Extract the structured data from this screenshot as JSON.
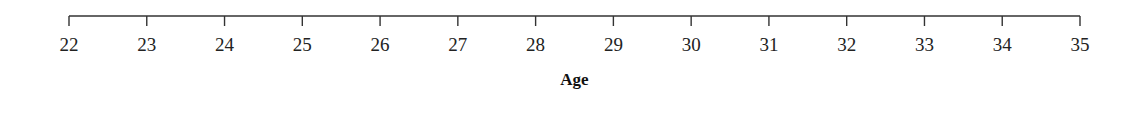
{
  "chart_data": {
    "type": "axis",
    "orientation": "horizontal",
    "xlabel": "Age",
    "ticks": [
      22,
      23,
      24,
      25,
      26,
      27,
      28,
      29,
      30,
      31,
      32,
      33,
      34,
      35
    ],
    "xlim": [
      22,
      35
    ],
    "grid": false,
    "series": []
  },
  "layout": {
    "x_start_px": 69,
    "x_end_px": 1080,
    "axis_y_px": 16,
    "tick_len_px": 10,
    "label_y_px": 51,
    "title_y_px": 85,
    "axis_color": "#333333"
  }
}
